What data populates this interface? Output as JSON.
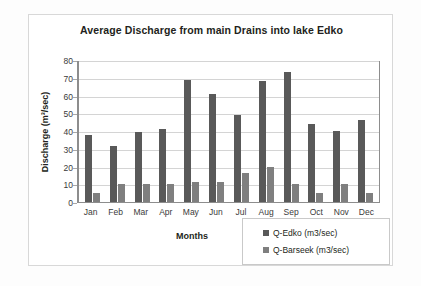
{
  "chart_data": {
    "type": "bar",
    "title": "Average Discharge from main Drains into lake Edko",
    "xlabel": "Months",
    "ylabel": "Discharge (m³/sec)",
    "categories": [
      "Jan",
      "Feb",
      "Mar",
      "Apr",
      "May",
      "Jun",
      "Jul",
      "Aug",
      "Sep",
      "Oct",
      "Nov",
      "Dec"
    ],
    "series": [
      {
        "name": "Q-Edko (m3/sec)",
        "color": "#595959",
        "values": [
          38,
          31.5,
          39.5,
          41,
          69,
          61,
          49,
          68,
          73,
          44,
          40,
          46
        ]
      },
      {
        "name": "Q-Barseek (m3/sec)",
        "color": "#7f7f7f",
        "values": [
          5,
          10,
          10,
          10,
          11,
          11,
          16.5,
          20,
          10,
          5,
          10,
          5
        ]
      }
    ],
    "ylim": [
      0,
      80
    ],
    "yticks": [
      0,
      10,
      20,
      30,
      40,
      50,
      60,
      70,
      80
    ],
    "ytick_labels": [
      "0",
      "10",
      "20",
      "30",
      "40",
      "50",
      "60",
      "70",
      "80"
    ],
    "grid": true,
    "legend_position": "bottom-right"
  }
}
